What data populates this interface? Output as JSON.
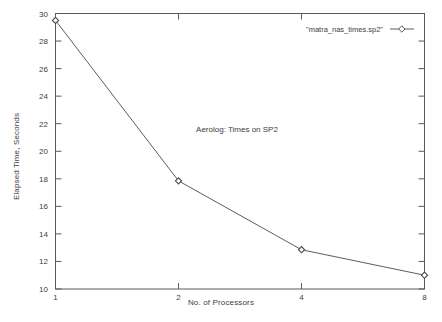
{
  "chart_data": {
    "type": "line",
    "title": "",
    "annotation": "Aerolog: Times on SP2",
    "xlabel": "No. of Processors",
    "ylabel": "Elapsed Time, Seconds",
    "xscale": "log2",
    "xlim": [
      1,
      8
    ],
    "ylim": [
      10,
      30
    ],
    "grid": false,
    "legend_position": "top-right",
    "xticks": [
      "1",
      "2",
      "4",
      "8"
    ],
    "xtick_values": [
      1,
      2,
      4,
      8
    ],
    "yticks": [
      "10",
      "12",
      "14",
      "16",
      "18",
      "20",
      "22",
      "24",
      "26",
      "28",
      "30"
    ],
    "ytick_values": [
      10,
      12,
      14,
      16,
      18,
      20,
      22,
      24,
      26,
      28,
      30
    ],
    "series": [
      {
        "name": "\"matra_nas_times.sp2\"",
        "marker": "diamond",
        "color": "#4a4a4a",
        "x": [
          1,
          2,
          4,
          8
        ],
        "values": [
          29.5,
          17.85,
          12.85,
          11.0
        ]
      }
    ]
  },
  "legend": {
    "entries": [
      {
        "label": "\"matra_nas_times.sp2\""
      }
    ]
  },
  "axes": {
    "x_title": "No. of Processors",
    "y_title": "Elapsed Time, Seconds"
  },
  "annotations": {
    "plot_note": "Aerolog: Times on SP2"
  },
  "colors": {
    "background": "#ffffff",
    "axis": "#5a5a5a",
    "line": "#4a4a4a",
    "text": "#3d3d3d"
  }
}
